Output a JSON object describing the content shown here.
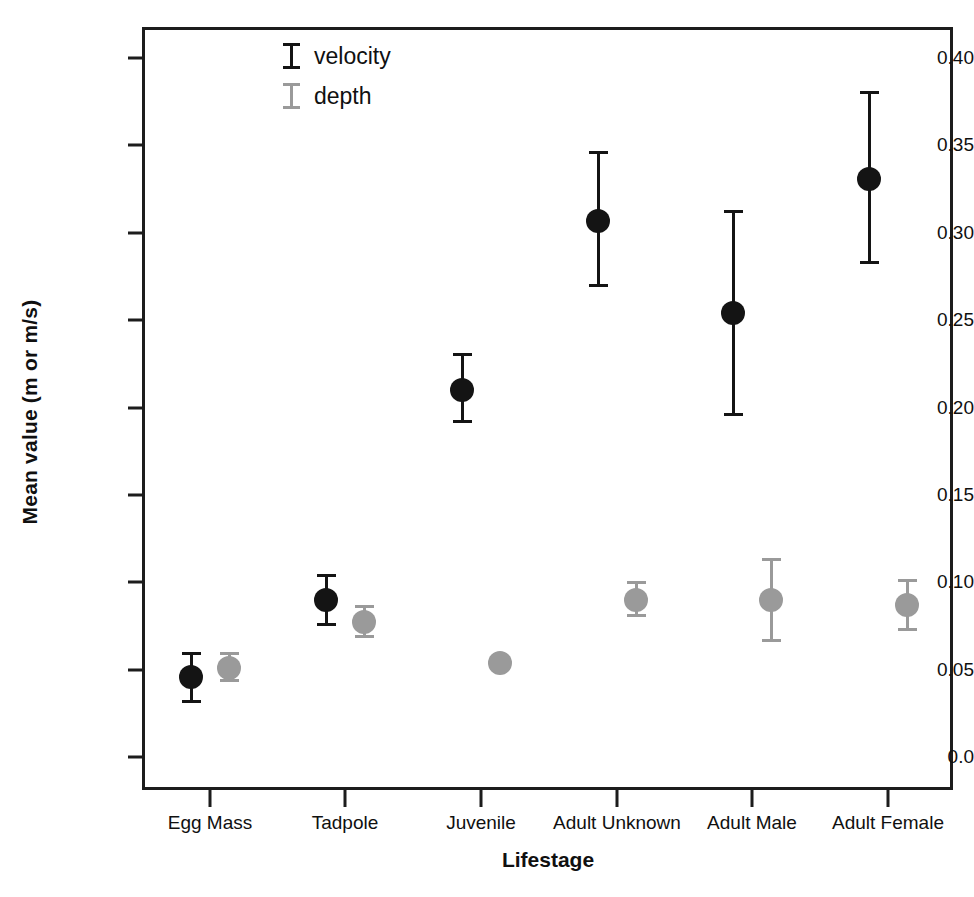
{
  "chart_data": {
    "type": "scatter",
    "title": "",
    "xlabel": "Lifestage",
    "ylabel": "Mean value (m or m/s)",
    "categories": [
      "Egg Mass",
      "Tadpole",
      "Juvenile",
      "Adult Unknown",
      "Adult Male",
      "Adult Female"
    ],
    "ylim": [
      0.0,
      0.4235
    ],
    "yticks": [
      0.0,
      0.05,
      0.1,
      0.15,
      0.2,
      0.25,
      0.3,
      0.35,
      0.4
    ],
    "ytick_labels": [
      "0.0",
      "0.05",
      "0.10",
      "0.15",
      "0.20",
      "0.25",
      "0.30",
      "0.35",
      "0.40"
    ],
    "grid": false,
    "legend_position": "top-left-inside",
    "series": [
      {
        "name": "velocity",
        "color": "#141414",
        "values": [
          0.046,
          0.09,
          0.21,
          0.307,
          0.254,
          0.331
        ],
        "err_low": [
          0.031,
          0.075,
          0.191,
          0.269,
          0.195,
          0.282
        ],
        "err_high": [
          0.06,
          0.105,
          0.231,
          0.347,
          0.313,
          0.381
        ]
      },
      {
        "name": "depth",
        "color": "#9a9a9a",
        "values": [
          0.051,
          0.077,
          0.054,
          0.09,
          0.09,
          0.087
        ],
        "err_low": [
          0.043,
          0.068,
          0.054,
          0.08,
          0.066,
          0.072
        ],
        "err_high": [
          0.06,
          0.087,
          0.054,
          0.101,
          0.114,
          0.102
        ]
      }
    ]
  },
  "legend": {
    "items": [
      {
        "label": "velocity",
        "color": "#141414"
      },
      {
        "label": "depth",
        "color": "#9a9a9a"
      }
    ]
  }
}
